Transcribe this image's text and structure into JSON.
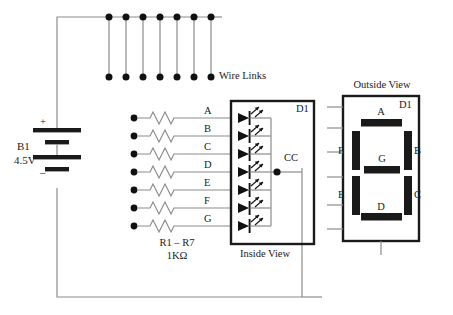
{
  "diagram": {
    "title_labels": {
      "wire_links": "Wire Links",
      "inside_view": "Inside View",
      "outside_view": "Outside View"
    },
    "battery": {
      "designator": "B1",
      "voltage": "4.5V",
      "plus": "+",
      "minus": "–"
    },
    "resistors": {
      "range_label": "R1 – R7",
      "value_label": "1KΩ",
      "count": 7
    },
    "segment_lines": [
      "A",
      "B",
      "C",
      "D",
      "E",
      "F",
      "G"
    ],
    "display_inside": {
      "designator": "D1",
      "common": "CC",
      "led_count": 7
    },
    "display_outside": {
      "designator": "D1",
      "segments": {
        "top": "A",
        "top_right": "B",
        "bottom_right": "C",
        "bottom": "D",
        "bottom_left": "E",
        "top_left": "F",
        "middle": "G"
      },
      "pin_count": 6
    },
    "wire_links": {
      "count": 7,
      "top_y": 17,
      "bottom_y": 77,
      "x_positions": [
        109,
        126,
        143,
        160,
        177,
        194,
        211
      ]
    },
    "colors": {
      "wire": "#8c8c8c",
      "ink": "#1a1a1a",
      "box_stroke": "#1a1a1a",
      "segment_fill": "#1a1a1a",
      "background": "#ffffff"
    }
  }
}
